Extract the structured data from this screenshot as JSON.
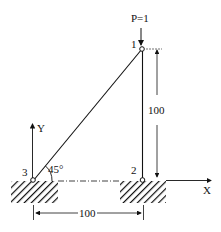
{
  "diagram": {
    "type": "two-bar truss",
    "load": {
      "label": "P=1",
      "node": 1,
      "direction": "down"
    },
    "nodes": [
      {
        "id": "1",
        "label": "1",
        "x": 100,
        "y": 100
      },
      {
        "id": "2",
        "label": "2",
        "x": 100,
        "y": 0
      },
      {
        "id": "3",
        "label": "3",
        "x": 0,
        "y": 0
      }
    ],
    "members": [
      {
        "from": "3",
        "to": "1"
      },
      {
        "from": "2",
        "to": "1"
      }
    ],
    "angle_label": "45°",
    "dimensions": {
      "vertical": "100",
      "horizontal": "100"
    },
    "axes": {
      "x_label": "X",
      "y_label": "Y"
    },
    "colors": {
      "ink": "#111111",
      "background": "#ffffff"
    }
  }
}
